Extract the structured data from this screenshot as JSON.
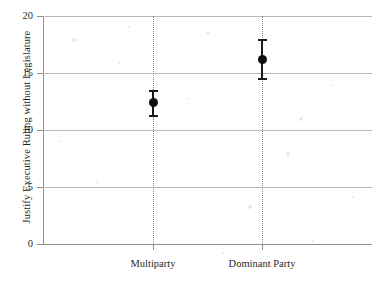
{
  "chart_data": {
    "type": "scatter",
    "title": "",
    "xlabel": "",
    "ylabel": "Justify Executive Ruling without Legislature",
    "categories": [
      "Multiparty",
      "Dominant Party"
    ],
    "ylim": [
      0,
      20
    ],
    "yticks": [
      0,
      5,
      10,
      15,
      20
    ],
    "ytick_labels": [
      "0",
      "5",
      "10",
      "15",
      "20"
    ],
    "grid": "horizontal",
    "legend": "none",
    "error_bar_style": "capped vertical interval",
    "reference_lines": "vertical dotted line at each category",
    "series": [
      {
        "name": "point estimate with confidence interval",
        "points": [
          {
            "category": "Multiparty",
            "value": 12.4,
            "ci_low": 11.2,
            "ci_high": 13.4
          },
          {
            "category": "Dominant Party",
            "value": 16.2,
            "ci_low": 14.5,
            "ci_high": 17.9
          }
        ]
      }
    ]
  },
  "axes": {
    "y_title": "Justify Executive Ruling without Legislature"
  },
  "colors": {
    "marker": "#111111",
    "error_bar": "#1a1a1a",
    "gridline": "#b9b9b9",
    "axis": "#8e8e8e",
    "reference_line": "#8a8a8a",
    "background": "#ffffff"
  }
}
